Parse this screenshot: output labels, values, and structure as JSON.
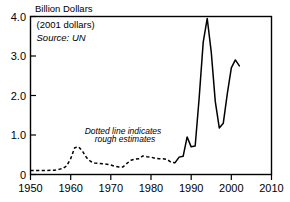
{
  "chart_data": {
    "type": "line",
    "title": "Billion Dollars",
    "xlabel": "",
    "ylabel": "Billion Dollars",
    "xlim": [
      1950,
      2010
    ],
    "ylim": [
      0,
      4.0
    ],
    "grid": false,
    "legend_position": "none",
    "x_ticks": [
      "1950",
      "1960",
      "1970",
      "1980",
      "1990",
      "2000",
      "2010"
    ],
    "x_tick_values": [
      1950,
      1960,
      1970,
      1980,
      1990,
      2000,
      2010
    ],
    "y_ticks": [
      "0",
      "1.0",
      "2.0",
      "3.0",
      "4.0"
    ],
    "y_tick_values": [
      0,
      1.0,
      2.0,
      3.0,
      4.0
    ],
    "annotations": [
      {
        "name": "currency-note",
        "text": "(2001 dollars)",
        "x": 1951.5,
        "y": 3.72,
        "style": "normal"
      },
      {
        "name": "source-note",
        "text": "Source: UN",
        "x": 1951.5,
        "y": 3.38,
        "style": "italic"
      },
      {
        "name": "dotted-line-note-line1",
        "text": "Dotted line indicates",
        "x": 1963.5,
        "y": 1.02,
        "style": "italic"
      },
      {
        "name": "dotted-line-note-line2",
        "text": "rough estimates",
        "x": 1966.0,
        "y": 0.82,
        "style": "italic"
      }
    ],
    "series": [
      {
        "name": "rough-estimates",
        "linestyle": "dotted",
        "color": "#000000",
        "x": [
          1950,
          1952,
          1954,
          1956,
          1957,
          1958,
          1959,
          1960,
          1961,
          1962,
          1963,
          1964,
          1965,
          1966,
          1967,
          1968,
          1969,
          1970,
          1971,
          1972,
          1973,
          1974,
          1975,
          1976,
          1977,
          1978,
          1979,
          1980,
          1981,
          1982,
          1983,
          1984,
          1985,
          1986
        ],
        "values": [
          0.1,
          0.1,
          0.1,
          0.11,
          0.13,
          0.15,
          0.22,
          0.4,
          0.68,
          0.7,
          0.58,
          0.42,
          0.33,
          0.29,
          0.28,
          0.27,
          0.26,
          0.24,
          0.21,
          0.19,
          0.19,
          0.28,
          0.36,
          0.39,
          0.4,
          0.47,
          0.45,
          0.44,
          0.41,
          0.4,
          0.4,
          0.38,
          0.31,
          0.3
        ]
      },
      {
        "name": "reported-values",
        "linestyle": "solid",
        "color": "#000000",
        "x": [
          1986,
          1987,
          1988,
          1989,
          1990,
          1991,
          1992,
          1993,
          1994,
          1995,
          1996,
          1997,
          1998,
          1999,
          2000,
          2001,
          2002
        ],
        "values": [
          0.3,
          0.44,
          0.46,
          0.95,
          0.7,
          0.72,
          1.95,
          3.35,
          3.95,
          3.1,
          1.85,
          1.18,
          1.3,
          2.05,
          2.7,
          2.9,
          2.75
        ]
      }
    ]
  },
  "axes_title": {
    "label": "Billion Dollars"
  }
}
